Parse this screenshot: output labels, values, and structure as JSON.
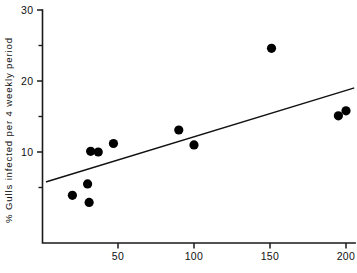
{
  "chart_data": {
    "type": "scatter",
    "title": "",
    "xlabel": "No. of reported bla...",
    "ylabel": "% Gulls infected per 4 weekly period",
    "xlim": [
      0,
      210
    ],
    "ylim": [
      0,
      30
    ],
    "grid": false,
    "legend": "none",
    "x_ticks_major": [
      50,
      100,
      150,
      200
    ],
    "x_tick_labels": [
      "50",
      "100",
      "150",
      "200"
    ],
    "y_ticks_major": [
      10,
      20,
      30
    ],
    "y_tick_labels": [
      "10",
      "20",
      "30"
    ],
    "y_ticks_minor": [
      5,
      15,
      25
    ],
    "points": [
      {
        "x": 20,
        "y": 3.9
      },
      {
        "x": 31,
        "y": 2.9
      },
      {
        "x": 32,
        "y": 10.1
      },
      {
        "x": 30,
        "y": 5.5
      },
      {
        "x": 37,
        "y": 10.0
      },
      {
        "x": 47,
        "y": 11.2
      },
      {
        "x": 90,
        "y": 13.1
      },
      {
        "x": 100,
        "y": 11.0
      },
      {
        "x": 151,
        "y": 24.6
      },
      {
        "x": 195,
        "y": 15.1
      },
      {
        "x": 200,
        "y": 15.8
      }
    ],
    "fit_line": {
      "x_start": 3,
      "y_start": 5.8,
      "x_end": 205,
      "y_end": 19.0
    },
    "marker_radius_px": 4.6,
    "point_color": "#000000",
    "line_color": "#111111",
    "axis_color": "#1a1a1a",
    "background": "#ffffff"
  }
}
